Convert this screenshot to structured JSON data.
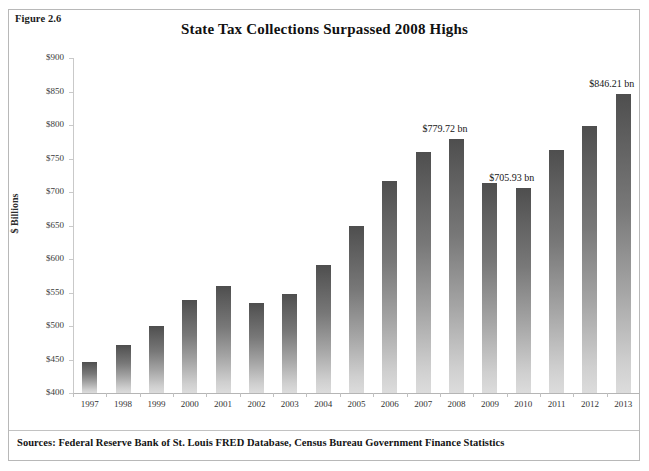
{
  "figure": {
    "number": "Figure 2.6",
    "sources": "Sources: Federal Reserve Bank of St. Louis FRED Database, Census Bureau Government Finance Statistics"
  },
  "chart_data": {
    "type": "bar",
    "title": "State Tax Collections Surpassed 2008 Highs",
    "xlabel": "",
    "ylabel": "$ Billions",
    "ylim": [
      400,
      900
    ],
    "ytick_labels": [
      "$900",
      "$850",
      "$800",
      "$750",
      "$700",
      "$650",
      "$600",
      "$550",
      "$500",
      "$450",
      "$400"
    ],
    "ytick_values": [
      900,
      850,
      800,
      750,
      700,
      650,
      600,
      550,
      500,
      450,
      400
    ],
    "grid": false,
    "legend": "none",
    "categories": [
      "1997",
      "1998",
      "1999",
      "2000",
      "2001",
      "2002",
      "2003",
      "2004",
      "2005",
      "2006",
      "2007",
      "2008",
      "2009",
      "2010",
      "2011",
      "2012",
      "2013"
    ],
    "values": [
      446,
      472,
      500,
      539,
      559,
      535,
      548,
      591,
      650,
      716,
      759,
      779.72,
      714,
      705.93,
      762,
      799,
      846.21
    ],
    "annotations": [
      {
        "category": "2008",
        "text": "$779.72 bn"
      },
      {
        "category": "2010",
        "text": "$705.93 bn"
      },
      {
        "category": "2013",
        "text": "$846.21 bn"
      }
    ]
  }
}
